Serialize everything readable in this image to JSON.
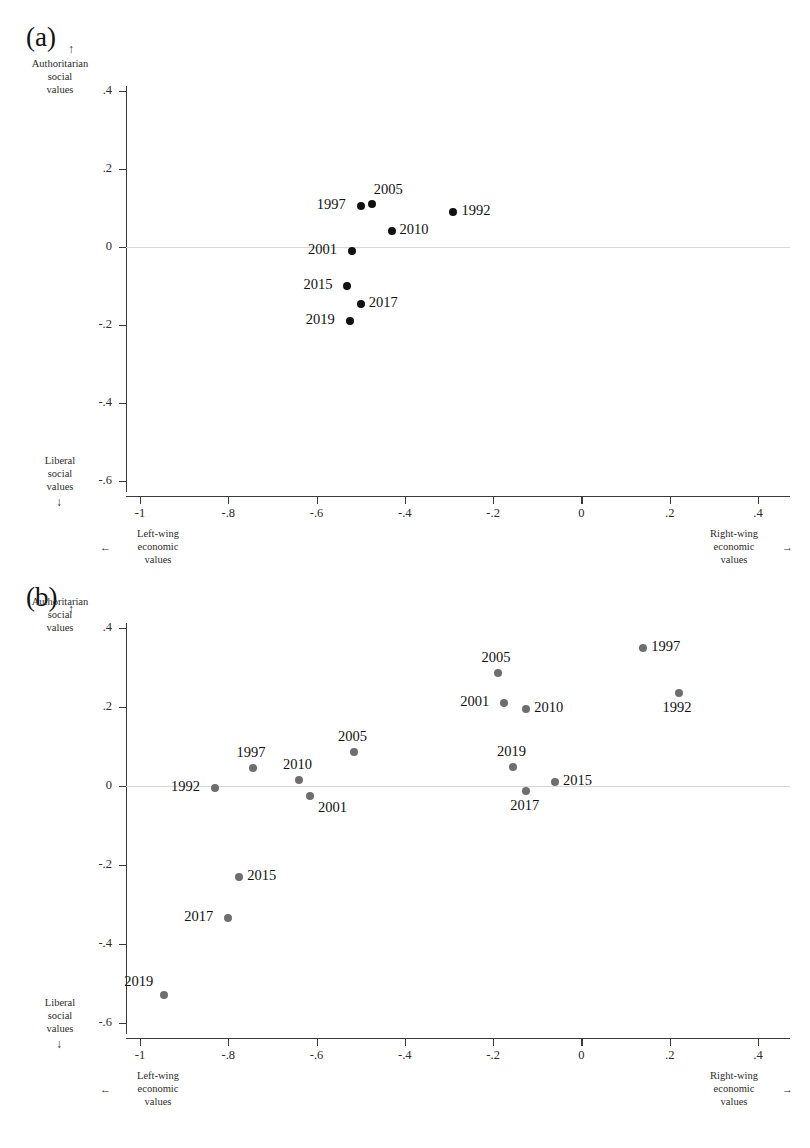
{
  "figure": {
    "panels": [
      {
        "label": "(a)",
        "marker_color": "#111111",
        "y_axis": {
          "top_caption": [
            "Authoritarian",
            "social",
            "values"
          ],
          "top_arrow": "↑",
          "bottom_caption": [
            "Liberal",
            "social",
            "values"
          ],
          "bottom_arrow": "↓",
          "ticks": [
            ".4",
            ".2",
            "0",
            "-.2",
            "-.4",
            "-.6"
          ],
          "tick_values": [
            0.4,
            0.2,
            0,
            -0.2,
            -0.4,
            -0.6
          ]
        },
        "x_axis": {
          "ticks": [
            "-1",
            "-.8",
            "-.6",
            "-.4",
            "-.2",
            "0",
            ".2",
            ".4"
          ],
          "tick_values": [
            -1,
            -0.8,
            -0.6,
            -0.4,
            -0.2,
            0,
            0.2,
            0.4
          ],
          "left_caption": [
            "Left-wing",
            "economic",
            "values"
          ],
          "left_arrow": "←",
          "right_caption": [
            "Right-wing",
            "economic",
            "values"
          ],
          "right_arrow": "→"
        },
        "points": [
          {
            "label": "1992",
            "x": -0.29,
            "y": 0.09,
            "label_side": "right"
          },
          {
            "label": "1997",
            "x": -0.5,
            "y": 0.105,
            "label_side": "left"
          },
          {
            "label": "2005",
            "x": -0.475,
            "y": 0.11,
            "label_side": "above-right"
          },
          {
            "label": "2010",
            "x": -0.43,
            "y": 0.04,
            "label_side": "right"
          },
          {
            "label": "2001",
            "x": -0.52,
            "y": -0.01,
            "label_side": "left"
          },
          {
            "label": "2015",
            "x": -0.53,
            "y": -0.1,
            "label_side": "left"
          },
          {
            "label": "2017",
            "x": -0.5,
            "y": -0.145,
            "label_side": "right"
          },
          {
            "label": "2019",
            "x": -0.525,
            "y": -0.19,
            "label_side": "left"
          }
        ]
      },
      {
        "label": "(b)",
        "marker_color": "#6e6e6e",
        "y_axis": {
          "top_caption": [
            "Authoritarian",
            "social",
            "values"
          ],
          "top_arrow": "↑",
          "bottom_caption": [
            "Liberal",
            "social",
            "values"
          ],
          "bottom_arrow": "↓",
          "ticks": [
            ".4",
            ".2",
            "0",
            "-.2",
            "-.4",
            "-.6"
          ],
          "tick_values": [
            0.4,
            0.2,
            0,
            -0.2,
            -0.4,
            -0.6
          ]
        },
        "x_axis": {
          "ticks": [
            "-1",
            "-.8",
            "-.6",
            "-.4",
            "-.2",
            "0",
            ".2",
            ".4"
          ],
          "tick_values": [
            -1,
            -0.8,
            -0.6,
            -0.4,
            -0.2,
            0,
            0.2,
            0.4
          ],
          "left_caption": [
            "Left-wing",
            "economic",
            "values"
          ],
          "left_arrow": "←",
          "right_caption": [
            "Right-wing",
            "economic",
            "values"
          ],
          "right_arrow": "→"
        },
        "points": [
          {
            "label": "1992",
            "x": -0.83,
            "y": -0.005,
            "label_side": "left"
          },
          {
            "label": "1997",
            "x": -0.745,
            "y": 0.045,
            "label_side": "above"
          },
          {
            "label": "2010",
            "x": -0.64,
            "y": 0.015,
            "label_side": "above"
          },
          {
            "label": "2001",
            "x": -0.615,
            "y": -0.025,
            "label_side": "below-right"
          },
          {
            "label": "2005",
            "x": -0.515,
            "y": 0.085,
            "label_side": "above"
          },
          {
            "label": "2015",
            "x": -0.775,
            "y": -0.23,
            "label_side": "right"
          },
          {
            "label": "2017",
            "x": -0.8,
            "y": -0.335,
            "label_side": "left"
          },
          {
            "label": "2019",
            "x": -0.945,
            "y": -0.53,
            "label_side": "above-left"
          },
          {
            "label": "2005",
            "x": -0.19,
            "y": 0.285,
            "label_side": "above"
          },
          {
            "label": "2001",
            "x": -0.175,
            "y": 0.21,
            "label_side": "left"
          },
          {
            "label": "2010",
            "x": -0.125,
            "y": 0.195,
            "label_side": "right"
          },
          {
            "label": "2019",
            "x": -0.155,
            "y": 0.048,
            "label_side": "above"
          },
          {
            "label": "2017",
            "x": -0.125,
            "y": -0.012,
            "label_side": "below"
          },
          {
            "label": "2015",
            "x": -0.06,
            "y": 0.01,
            "label_side": "right"
          },
          {
            "label": "1997",
            "x": 0.14,
            "y": 0.35,
            "label_side": "right"
          },
          {
            "label": "1992",
            "x": 0.22,
            "y": 0.235,
            "label_side": "below"
          }
        ]
      }
    ]
  },
  "chart_data": [
    {
      "type": "scatter",
      "title": "(a)",
      "xlabel": "Left-wing economic values ← / → Right-wing economic values",
      "ylabel": "Liberal social values ↓ / ↑ Authoritarian social values",
      "xlim": [
        -1.05,
        0.42
      ],
      "ylim": [
        -0.62,
        0.42
      ],
      "xticks": [
        -1,
        -0.8,
        -0.6,
        -0.4,
        -0.2,
        0,
        0.2,
        0.4
      ],
      "xticklabels": [
        "-1",
        "-.8",
        "-.6",
        "-.4",
        "-.2",
        "0",
        ".2",
        ".4"
      ],
      "yticks": [
        0.4,
        0.2,
        0,
        -0.2,
        -0.4,
        -0.6
      ],
      "yticklabels": [
        ".4",
        ".2",
        "0",
        "-.2",
        "-.4",
        "-.6"
      ],
      "grid": false,
      "legend": "none",
      "marker_color": "#111111",
      "labels": [
        "1992",
        "1997",
        "2005",
        "2010",
        "2001",
        "2015",
        "2017",
        "2019"
      ],
      "x": [
        -0.29,
        -0.5,
        -0.475,
        -0.43,
        -0.52,
        -0.53,
        -0.5,
        -0.525
      ],
      "y": [
        0.09,
        0.105,
        0.11,
        0.04,
        -0.01,
        -0.1,
        -0.145,
        -0.19
      ]
    },
    {
      "type": "scatter",
      "title": "(b)",
      "xlabel": "Left-wing economic values ← / → Right-wing economic values",
      "ylabel": "Liberal social values ↓ / ↑ Authoritarian social values",
      "xlim": [
        -1.05,
        0.42
      ],
      "ylim": [
        -0.62,
        0.42
      ],
      "xticks": [
        -1,
        -0.8,
        -0.6,
        -0.4,
        -0.2,
        0,
        0.2,
        0.4
      ],
      "xticklabels": [
        "-1",
        "-.8",
        "-.6",
        "-.4",
        "-.2",
        "0",
        ".2",
        ".4"
      ],
      "yticks": [
        0.4,
        0.2,
        0,
        -0.2,
        -0.4,
        -0.6
      ],
      "yticklabels": [
        ".4",
        ".2",
        "0",
        "-.2",
        "-.4",
        "-.6"
      ],
      "grid": false,
      "legend": "none",
      "marker_color": "#6e6e6e",
      "labels": [
        "1992",
        "1997",
        "2010",
        "2001",
        "2005",
        "2015",
        "2017",
        "2019",
        "2005",
        "2001",
        "2010",
        "2019",
        "2017",
        "2015",
        "1997",
        "1992"
      ],
      "x": [
        -0.83,
        -0.745,
        -0.64,
        -0.615,
        -0.515,
        -0.775,
        -0.8,
        -0.945,
        -0.19,
        -0.175,
        -0.125,
        -0.155,
        -0.125,
        -0.06,
        0.14,
        0.22
      ],
      "y": [
        -0.005,
        0.045,
        0.015,
        -0.025,
        0.085,
        -0.23,
        -0.335,
        -0.53,
        0.285,
        0.21,
        0.195,
        0.048,
        -0.012,
        0.01,
        0.35,
        0.235
      ]
    }
  ]
}
